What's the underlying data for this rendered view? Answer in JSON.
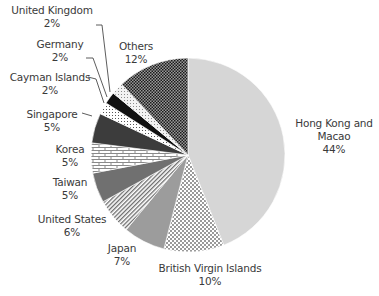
{
  "chart_data": {
    "type": "pie",
    "title": "",
    "start_angle_deg": 0,
    "direction": "clockwise",
    "slices": [
      {
        "label": "Hong Kong and Macao",
        "value": 44,
        "pct": "44%",
        "fill": "#d6d6d6",
        "pattern": "solid"
      },
      {
        "label": "British Virgin Islands",
        "value": 10,
        "pct": "10%",
        "fill": "#ffffff",
        "pattern": "checker-light"
      },
      {
        "label": "Japan",
        "value": 7,
        "pct": "7%",
        "fill": "#9c9c9c",
        "pattern": "solid"
      },
      {
        "label": "United States",
        "value": 6,
        "pct": "6%",
        "fill": "#ffffff",
        "pattern": "diagonal-stripes"
      },
      {
        "label": "Taiwan",
        "value": 5,
        "pct": "5%",
        "fill": "#707070",
        "pattern": "solid"
      },
      {
        "label": "Korea",
        "value": 5,
        "pct": "5%",
        "fill": "#ffffff",
        "pattern": "brick"
      },
      {
        "label": "Singapore",
        "value": 5,
        "pct": "5%",
        "fill": "#3c3c3c",
        "pattern": "solid"
      },
      {
        "label": "Cayman Islands",
        "value": 2,
        "pct": "2%",
        "fill": "#ffffff",
        "pattern": "dots"
      },
      {
        "label": "Germany",
        "value": 2,
        "pct": "2%",
        "fill": "#111111",
        "pattern": "solid"
      },
      {
        "label": "United Kingdom",
        "value": 2,
        "pct": "2%",
        "fill": "#e8e8e8",
        "pattern": "dots-light"
      },
      {
        "label": "Others",
        "value": 12,
        "pct": "12%",
        "fill": "#2a2a2a",
        "pattern": "checker-dark"
      }
    ]
  },
  "labels": {
    "hk": {
      "name": "Hong Kong and",
      "name2": "Macao",
      "pct": "44%"
    },
    "bvi": {
      "name": "British Virgin Islands",
      "pct": "10%"
    },
    "japan": {
      "name": "Japan",
      "pct": "7%"
    },
    "us": {
      "name": "United States",
      "pct": "6%"
    },
    "taiwan": {
      "name": "Taiwan",
      "pct": "5%"
    },
    "korea": {
      "name": "Korea",
      "pct": "5%"
    },
    "singapore": {
      "name": "Singapore",
      "pct": "5%"
    },
    "cayman": {
      "name": "Cayman Islands",
      "pct": "2%"
    },
    "germany": {
      "name": "Germany",
      "pct": "2%"
    },
    "uk": {
      "name": "United Kingdom",
      "pct": "2%"
    },
    "others": {
      "name": "Others",
      "pct": "12%"
    }
  }
}
